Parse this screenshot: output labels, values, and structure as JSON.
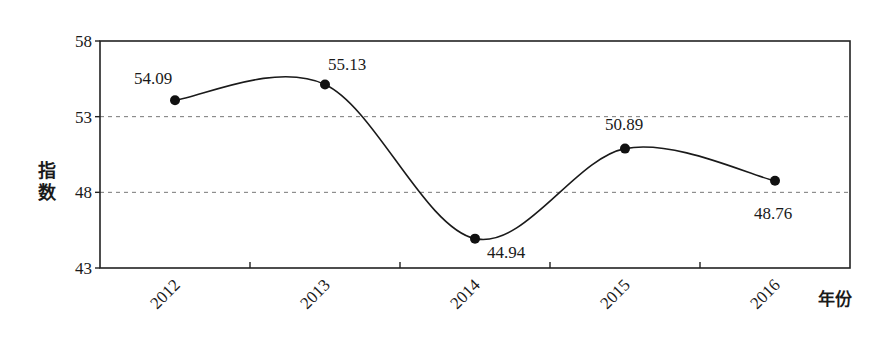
{
  "chart_data": {
    "type": "line",
    "title": "",
    "xlabel": "年份",
    "ylabel": "指数",
    "categories": [
      "2012",
      "2013",
      "2014",
      "2015",
      "2016"
    ],
    "values": [
      54.09,
      55.13,
      44.94,
      50.89,
      48.76
    ],
    "data_labels": [
      "54.09",
      "55.13",
      "44.94",
      "50.89",
      "48.76"
    ],
    "ylim": [
      43,
      58
    ],
    "yticks": [
      43,
      48,
      53,
      58
    ],
    "ytick_labels": [
      "43",
      "48",
      "53",
      "58"
    ],
    "gridlines": {
      "style": "dashed",
      "at": [
        48,
        53
      ]
    },
    "line_style": "smooth",
    "marker": "filled-circle",
    "legend": null
  },
  "axes": {
    "y_title": "指数",
    "x_title": "年份"
  }
}
